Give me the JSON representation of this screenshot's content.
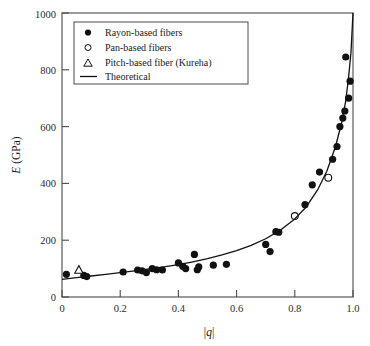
{
  "chart_data": {
    "type": "scatter",
    "title": "",
    "xlabel": "|q|",
    "ylabel": "E (GPa)",
    "xlim": [
      0,
      1.0
    ],
    "ylim": [
      0,
      1000
    ],
    "xticks": [
      "0",
      "0.2",
      "0.4",
      "0.6",
      "0.8",
      "1.0"
    ],
    "xtick_values": [
      0,
      0.2,
      0.4,
      0.6,
      0.8,
      1.0
    ],
    "yticks": [
      "0",
      "200",
      "400",
      "600",
      "800",
      "1000"
    ],
    "ytick_values": [
      0,
      200,
      400,
      600,
      800,
      1000
    ],
    "grid": false,
    "legend_position": "top-left-inside",
    "series": [
      {
        "name": "Rayon-based fibers",
        "marker": "filled-circle",
        "color": "#111111",
        "points": [
          [
            0.015,
            80
          ],
          [
            0.075,
            76
          ],
          [
            0.085,
            72
          ],
          [
            0.21,
            88
          ],
          [
            0.26,
            95
          ],
          [
            0.275,
            92
          ],
          [
            0.29,
            86
          ],
          [
            0.31,
            100
          ],
          [
            0.325,
            96
          ],
          [
            0.345,
            95
          ],
          [
            0.4,
            120
          ],
          [
            0.415,
            108
          ],
          [
            0.425,
            100
          ],
          [
            0.455,
            150
          ],
          [
            0.465,
            96
          ],
          [
            0.47,
            106
          ],
          [
            0.52,
            112
          ],
          [
            0.565,
            115
          ],
          [
            0.7,
            185
          ],
          [
            0.715,
            160
          ],
          [
            0.735,
            230
          ],
          [
            0.745,
            228
          ],
          [
            0.835,
            325
          ],
          [
            0.86,
            395
          ],
          [
            0.885,
            440
          ],
          [
            0.93,
            485
          ],
          [
            0.945,
            530
          ],
          [
            0.955,
            600
          ],
          [
            0.965,
            630
          ],
          [
            0.972,
            655
          ],
          [
            0.975,
            845
          ],
          [
            0.985,
            700
          ],
          [
            0.99,
            760
          ]
        ]
      },
      {
        "name": "Pan-based fibers",
        "marker": "open-circle",
        "color": "#111111",
        "points": [
          [
            0.8,
            285
          ],
          [
            0.915,
            420
          ]
        ]
      },
      {
        "name": "Pitch-based fiber (Kureha)",
        "marker": "open-triangle",
        "color": "#111111",
        "points": [
          [
            0.058,
            95
          ]
        ]
      },
      {
        "name": "Theoretical",
        "marker": "line",
        "color": "#111111",
        "curve": [
          [
            0.0,
            62
          ],
          [
            0.05,
            68
          ],
          [
            0.1,
            74
          ],
          [
            0.15,
            80
          ],
          [
            0.2,
            86
          ],
          [
            0.25,
            92
          ],
          [
            0.3,
            99
          ],
          [
            0.35,
            106
          ],
          [
            0.4,
            114
          ],
          [
            0.45,
            124
          ],
          [
            0.5,
            135
          ],
          [
            0.55,
            148
          ],
          [
            0.6,
            163
          ],
          [
            0.65,
            182
          ],
          [
            0.7,
            205
          ],
          [
            0.75,
            235
          ],
          [
            0.8,
            275
          ],
          [
            0.84,
            318
          ],
          [
            0.88,
            380
          ],
          [
            0.91,
            443
          ],
          [
            0.94,
            530
          ],
          [
            0.96,
            610
          ],
          [
            0.975,
            690
          ],
          [
            0.985,
            775
          ],
          [
            0.993,
            860
          ],
          [
            1.0,
            1000
          ]
        ]
      }
    ],
    "legend": [
      {
        "label": "Rayon-based fibers",
        "marker": "filled-circle"
      },
      {
        "label": "Pan-based fibers",
        "marker": "open-circle"
      },
      {
        "label": "Pitch-based fiber (Kureha)",
        "marker": "open-triangle"
      },
      {
        "label": "Theoretical",
        "marker": "line"
      }
    ]
  }
}
